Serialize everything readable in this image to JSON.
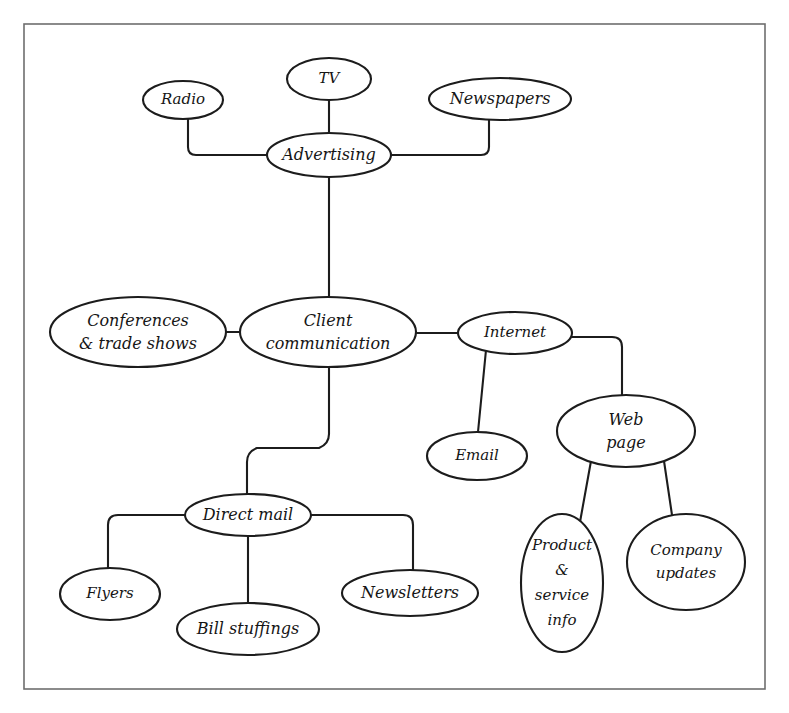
{
  "diagram": {
    "background_color": "#ffffff",
    "frame_color": "#6e6e6e",
    "node_stroke_color": "#1c1c1c",
    "node_fill_color": "#ffffff",
    "text_color": "#151515",
    "nodes": [
      {
        "id": "tv",
        "label": "TV",
        "lines": [
          "TV"
        ],
        "cx": 329,
        "cy": 79,
        "rx": 42,
        "ry": 21
      },
      {
        "id": "radio",
        "label": "Radio",
        "lines": [
          "Radio"
        ],
        "cx": 183,
        "cy": 100,
        "rx": 40,
        "ry": 19
      },
      {
        "id": "newspapers",
        "label": "Newspapers",
        "lines": [
          "Newspapers"
        ],
        "cx": 500,
        "cy": 99,
        "rx": 71,
        "ry": 21
      },
      {
        "id": "advertising",
        "label": "Advertising",
        "lines": [
          "Advertising"
        ],
        "cx": 329,
        "cy": 155,
        "rx": 62,
        "ry": 22
      },
      {
        "id": "conferences",
        "label": "Conferences & trade shows",
        "lines": [
          "Conferences",
          "& trade shows"
        ],
        "cx": 138,
        "cy": 332,
        "rx": 88,
        "ry": 35
      },
      {
        "id": "client",
        "label": "Client communication",
        "lines": [
          "Client",
          "communication"
        ],
        "cx": 328,
        "cy": 332,
        "rx": 88,
        "ry": 35
      },
      {
        "id": "internet",
        "label": "Internet",
        "lines": [
          "Internet"
        ],
        "cx": 515,
        "cy": 333,
        "rx": 57,
        "ry": 21
      },
      {
        "id": "email",
        "label": "Email",
        "lines": [
          "Email"
        ],
        "cx": 477,
        "cy": 456,
        "rx": 50,
        "ry": 24
      },
      {
        "id": "webpage",
        "label": "Web page",
        "lines": [
          "Web",
          "page"
        ],
        "cx": 626,
        "cy": 431,
        "rx": 69,
        "ry": 36
      },
      {
        "id": "directmail",
        "label": "Direct mail",
        "lines": [
          "Direct mail"
        ],
        "cx": 248,
        "cy": 515,
        "rx": 63,
        "ry": 21
      },
      {
        "id": "flyers",
        "label": "Flyers",
        "lines": [
          "Flyers"
        ],
        "cx": 110,
        "cy": 594,
        "rx": 50,
        "ry": 26
      },
      {
        "id": "billstuff",
        "label": "Bill stuffings",
        "lines": [
          "Bill stuffings"
        ],
        "cx": 248,
        "cy": 629,
        "rx": 71,
        "ry": 26
      },
      {
        "id": "newsletters",
        "label": "Newsletters",
        "lines": [
          "Newsletters"
        ],
        "cx": 410,
        "cy": 593,
        "rx": 68,
        "ry": 23
      },
      {
        "id": "product",
        "label": "Product & service info",
        "lines": [
          "Product",
          "&",
          "service",
          "info"
        ],
        "cx": 562,
        "cy": 583,
        "rx": 41,
        "ry": 69
      },
      {
        "id": "company",
        "label": "Company updates",
        "lines": [
          "Company",
          "updates"
        ],
        "cx": 686,
        "cy": 562,
        "rx": 59,
        "ry": 48
      }
    ],
    "edges": [
      {
        "id": "edge-advertising-tv",
        "from": "advertising",
        "to": "tv",
        "path": "M 329 133 L 329 100"
      },
      {
        "id": "edge-advertising-radio",
        "from": "advertising",
        "to": "radio",
        "path": "M 267 155 L 196 155 Q 188 155 188 147 L 188 119"
      },
      {
        "id": "edge-advertising-newspapers",
        "from": "advertising",
        "to": "newspapers",
        "path": "M 391 155 L 481 155 Q 489 155 489 147 L 489 120"
      },
      {
        "id": "edge-advertising-client",
        "from": "advertising",
        "to": "client",
        "path": "M 329 177 L 329 297"
      },
      {
        "id": "edge-client-conferences",
        "from": "client",
        "to": "conferences",
        "path": "M 240 332 L 226 332"
      },
      {
        "id": "edge-client-internet",
        "from": "client",
        "to": "internet",
        "path": "M 416 333 L 458 333"
      },
      {
        "id": "edge-client-directmail",
        "from": "client",
        "to": "directmail",
        "path": "M 329 367 L 329 434 Q 329 444 319 448 L 257 448 Q 247 452 247 462 L 247 494"
      },
      {
        "id": "edge-internet-email",
        "from": "internet",
        "to": "email",
        "path": "M 486 350 L 478 432"
      },
      {
        "id": "edge-internet-webpage",
        "from": "internet",
        "to": "webpage",
        "path": "M 572 337 L 612 337 Q 622 337 622 347 L 622 396"
      },
      {
        "id": "edge-webpage-product",
        "from": "webpage",
        "to": "product",
        "path": "M 591 461 L 580 522"
      },
      {
        "id": "edge-webpage-company",
        "from": "webpage",
        "to": "company",
        "path": "M 664 461 L 672 515"
      },
      {
        "id": "edge-directmail-flyers",
        "from": "directmail",
        "to": "flyers",
        "path": "M 186 515 L 118 515 Q 108 515 108 525 L 108 568"
      },
      {
        "id": "edge-directmail-billstuff",
        "from": "directmail",
        "to": "billstuff",
        "path": "M 248 536 L 248 603"
      },
      {
        "id": "edge-directmail-newsletters",
        "from": "directmail",
        "to": "newsletters",
        "path": "M 311 515 L 403 515 Q 413 515 413 525 L 413 570"
      }
    ],
    "frame": {
      "x": 24,
      "y": 24,
      "width": 741,
      "height": 665
    }
  }
}
